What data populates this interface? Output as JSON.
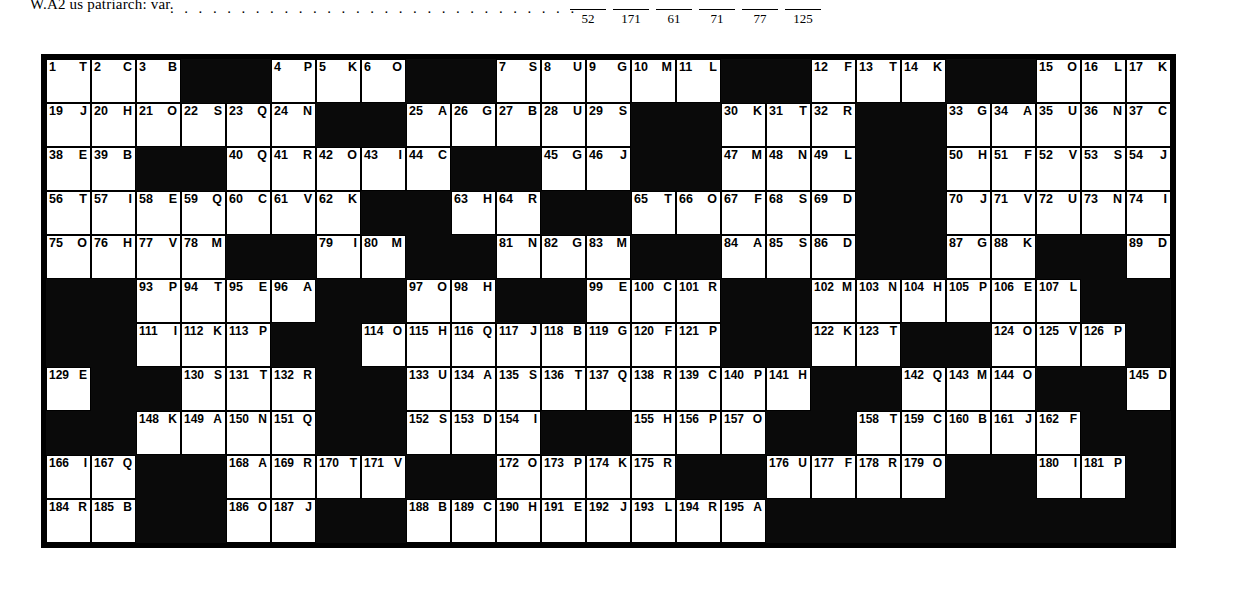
{
  "top_strip": {
    "clue_fragment": "W.A2 us patriarch: var.",
    "dot_leader": ". . . . . . . . . . . . . . . . . . . . . . . . . . . . .",
    "answer_blank_numbers": [
      "52",
      "171",
      "61",
      "71",
      "77",
      "125"
    ]
  },
  "grid": {
    "columns": 25,
    "rows": 11,
    "total_numbered_cells": 195,
    "black_color": "#0a0a0a",
    "white_color": "#ffffff",
    "cells": [
      [
        {
          "n": "1",
          "l": "T"
        },
        {
          "n": "2",
          "l": "C"
        },
        {
          "n": "3",
          "l": "B"
        },
        {
          "black": true
        },
        {
          "black": true
        },
        {
          "n": "4",
          "l": "P"
        },
        {
          "n": "5",
          "l": "K"
        },
        {
          "n": "6",
          "l": "O"
        },
        {
          "black": true
        },
        {
          "black": true
        },
        {
          "n": "7",
          "l": "S"
        },
        {
          "n": "8",
          "l": "U"
        },
        {
          "n": "9",
          "l": "G"
        },
        {
          "n": "10",
          "l": "M"
        },
        {
          "n": "11",
          "l": "L"
        },
        {
          "black": true
        },
        {
          "black": true
        },
        {
          "n": "12",
          "l": "F"
        },
        {
          "n": "13",
          "l": "T"
        },
        {
          "n": "14",
          "l": "K"
        },
        {
          "black": true
        },
        {
          "black": true
        },
        {
          "n": "15",
          "l": "O"
        },
        {
          "n": "16",
          "l": "L"
        },
        {
          "n": "17",
          "l": "K"
        }
      ],
      [
        {
          "n": "19",
          "l": "J"
        },
        {
          "n": "20",
          "l": "H"
        },
        {
          "n": "21",
          "l": "O"
        },
        {
          "n": "22",
          "l": "S"
        },
        {
          "n": "23",
          "l": "Q"
        },
        {
          "n": "24",
          "l": "N"
        },
        {
          "black": true
        },
        {
          "black": true
        },
        {
          "n": "25",
          "l": "A"
        },
        {
          "n": "26",
          "l": "G"
        },
        {
          "n": "27",
          "l": "B"
        },
        {
          "n": "28",
          "l": "U"
        },
        {
          "n": "29",
          "l": "S"
        },
        {
          "black": true
        },
        {
          "black": true
        },
        {
          "n": "30",
          "l": "K"
        },
        {
          "n": "31",
          "l": "T"
        },
        {
          "n": "32",
          "l": "R"
        },
        {
          "black": true
        },
        {
          "black": true
        },
        {
          "n": "33",
          "l": "G"
        },
        {
          "n": "34",
          "l": "A"
        },
        {
          "n": "35",
          "l": "U"
        },
        {
          "n": "36",
          "l": "N"
        },
        {
          "n": "37",
          "l": "C"
        }
      ],
      [
        {
          "n": "38",
          "l": "E"
        },
        {
          "n": "39",
          "l": "B"
        },
        {
          "black": true
        },
        {
          "black": true
        },
        {
          "n": "40",
          "l": "Q"
        },
        {
          "n": "41",
          "l": "R"
        },
        {
          "n": "42",
          "l": "O"
        },
        {
          "n": "43",
          "l": "I"
        },
        {
          "n": "44",
          "l": "C"
        },
        {
          "black": true
        },
        {
          "black": true
        },
        {
          "n": "45",
          "l": "G"
        },
        {
          "n": "46",
          "l": "J"
        },
        {
          "black": true
        },
        {
          "black": true
        },
        {
          "n": "47",
          "l": "M"
        },
        {
          "n": "48",
          "l": "N"
        },
        {
          "n": "49",
          "l": "L"
        },
        {
          "black": true
        },
        {
          "black": true
        },
        {
          "n": "50",
          "l": "H"
        },
        {
          "n": "51",
          "l": "F"
        },
        {
          "n": "52",
          "l": "V"
        },
        {
          "n": "53",
          "l": "S"
        },
        {
          "n": "54",
          "l": "J"
        }
      ],
      [
        {
          "n": "56",
          "l": "T"
        },
        {
          "n": "57",
          "l": "I"
        },
        {
          "n": "58",
          "l": "E"
        },
        {
          "n": "59",
          "l": "Q"
        },
        {
          "n": "60",
          "l": "C"
        },
        {
          "n": "61",
          "l": "V"
        },
        {
          "n": "62",
          "l": "K"
        },
        {
          "black": true
        },
        {
          "black": true
        },
        {
          "n": "63",
          "l": "H"
        },
        {
          "n": "64",
          "l": "R"
        },
        {
          "black": true
        },
        {
          "black": true
        },
        {
          "n": "65",
          "l": "T"
        },
        {
          "n": "66",
          "l": "O"
        },
        {
          "n": "67",
          "l": "F"
        },
        {
          "n": "68",
          "l": "S"
        },
        {
          "n": "69",
          "l": "D"
        },
        {
          "black": true
        },
        {
          "black": true
        },
        {
          "n": "70",
          "l": "J"
        },
        {
          "n": "71",
          "l": "V"
        },
        {
          "n": "72",
          "l": "U"
        },
        {
          "n": "73",
          "l": "N"
        },
        {
          "n": "74",
          "l": "I"
        }
      ],
      [
        {
          "n": "75",
          "l": "O"
        },
        {
          "n": "76",
          "l": "H"
        },
        {
          "n": "77",
          "l": "V"
        },
        {
          "n": "78",
          "l": "M"
        },
        {
          "black": true
        },
        {
          "black": true
        },
        {
          "n": "79",
          "l": "I"
        },
        {
          "n": "80",
          "l": "M"
        },
        {
          "black": true
        },
        {
          "black": true
        },
        {
          "n": "81",
          "l": "N"
        },
        {
          "n": "82",
          "l": "G"
        },
        {
          "n": "83",
          "l": "M"
        },
        {
          "black": true
        },
        {
          "black": true
        },
        {
          "n": "84",
          "l": "A"
        },
        {
          "n": "85",
          "l": "S"
        },
        {
          "n": "86",
          "l": "D"
        },
        {
          "black": true
        },
        {
          "black": true
        },
        {
          "n": "87",
          "l": "G"
        },
        {
          "n": "88",
          "l": "K"
        },
        {
          "black": true
        },
        {
          "black": true
        },
        {
          "n": "89",
          "l": "D"
        }
      ],
      [
        {
          "black": true
        },
        {
          "black": true
        },
        {
          "n": "93",
          "l": "P"
        },
        {
          "n": "94",
          "l": "T"
        },
        {
          "n": "95",
          "l": "E"
        },
        {
          "n": "96",
          "l": "A"
        },
        {
          "black": true
        },
        {
          "black": true
        },
        {
          "n": "97",
          "l": "O"
        },
        {
          "n": "98",
          "l": "H"
        },
        {
          "black": true
        },
        {
          "black": true
        },
        {
          "n": "99",
          "l": "E"
        },
        {
          "n": "100",
          "l": "C"
        },
        {
          "n": "101",
          "l": "R"
        },
        {
          "black": true
        },
        {
          "black": true
        },
        {
          "n": "102",
          "l": "M"
        },
        {
          "n": "103",
          "l": "N"
        },
        {
          "n": "104",
          "l": "H"
        },
        {
          "n": "105",
          "l": "P"
        },
        {
          "n": "106",
          "l": "E"
        },
        {
          "n": "107",
          "l": "L"
        },
        {
          "black": true
        },
        {
          "black": true
        }
      ],
      [
        {
          "black": true
        },
        {
          "black": true
        },
        {
          "n": "111",
          "l": "I"
        },
        {
          "n": "112",
          "l": "K"
        },
        {
          "n": "113",
          "l": "P"
        },
        {
          "black": true
        },
        {
          "black": true
        },
        {
          "n": "114",
          "l": "O"
        },
        {
          "n": "115",
          "l": "H"
        },
        {
          "n": "116",
          "l": "Q"
        },
        {
          "n": "117",
          "l": "J"
        },
        {
          "n": "118",
          "l": "B"
        },
        {
          "n": "119",
          "l": "G"
        },
        {
          "n": "120",
          "l": "F"
        },
        {
          "n": "121",
          "l": "P"
        },
        {
          "black": true
        },
        {
          "black": true
        },
        {
          "n": "122",
          "l": "K"
        },
        {
          "n": "123",
          "l": "T"
        },
        {
          "black": true
        },
        {
          "black": true
        },
        {
          "n": "124",
          "l": "O"
        },
        {
          "n": "125",
          "l": "V"
        },
        {
          "n": "126",
          "l": "P"
        },
        {
          "black": true
        }
      ],
      [
        {
          "n": "129",
          "l": "E"
        },
        {
          "black": true
        },
        {
          "black": true
        },
        {
          "n": "130",
          "l": "S"
        },
        {
          "n": "131",
          "l": "T"
        },
        {
          "n": "132",
          "l": "R"
        },
        {
          "black": true
        },
        {
          "black": true
        },
        {
          "n": "133",
          "l": "U"
        },
        {
          "n": "134",
          "l": "A"
        },
        {
          "n": "135",
          "l": "S"
        },
        {
          "n": "136",
          "l": "T"
        },
        {
          "n": "137",
          "l": "Q"
        },
        {
          "n": "138",
          "l": "R"
        },
        {
          "n": "139",
          "l": "C"
        },
        {
          "n": "140",
          "l": "P"
        },
        {
          "n": "141",
          "l": "H"
        },
        {
          "black": true
        },
        {
          "black": true
        },
        {
          "n": "142",
          "l": "Q"
        },
        {
          "n": "143",
          "l": "M"
        },
        {
          "n": "144",
          "l": "O"
        },
        {
          "black": true
        },
        {
          "black": true
        },
        {
          "n": "145",
          "l": "D"
        }
      ],
      [
        {
          "black": true
        },
        {
          "black": true
        },
        {
          "n": "148",
          "l": "K"
        },
        {
          "n": "149",
          "l": "A"
        },
        {
          "n": "150",
          "l": "N"
        },
        {
          "n": "151",
          "l": "Q"
        },
        {
          "black": true
        },
        {
          "black": true
        },
        {
          "n": "152",
          "l": "S"
        },
        {
          "n": "153",
          "l": "D"
        },
        {
          "n": "154",
          "l": "I"
        },
        {
          "black": true
        },
        {
          "black": true
        },
        {
          "n": "155",
          "l": "H"
        },
        {
          "n": "156",
          "l": "P"
        },
        {
          "n": "157",
          "l": "O"
        },
        {
          "black": true
        },
        {
          "black": true
        },
        {
          "n": "158",
          "l": "T"
        },
        {
          "n": "159",
          "l": "C"
        },
        {
          "n": "160",
          "l": "B"
        },
        {
          "n": "161",
          "l": "J"
        },
        {
          "n": "162",
          "l": "F"
        },
        {
          "black": true
        },
        {
          "black": true
        }
      ],
      [
        {
          "n": "166",
          "l": "I"
        },
        {
          "n": "167",
          "l": "Q"
        },
        {
          "black": true
        },
        {
          "black": true
        },
        {
          "n": "168",
          "l": "A"
        },
        {
          "n": "169",
          "l": "R"
        },
        {
          "n": "170",
          "l": "T"
        },
        {
          "n": "171",
          "l": "V"
        },
        {
          "black": true
        },
        {
          "black": true
        },
        {
          "n": "172",
          "l": "O"
        },
        {
          "n": "173",
          "l": "P"
        },
        {
          "n": "174",
          "l": "K"
        },
        {
          "n": "175",
          "l": "R"
        },
        {
          "black": true
        },
        {
          "black": true
        },
        {
          "n": "176",
          "l": "U"
        },
        {
          "n": "177",
          "l": "F"
        },
        {
          "n": "178",
          "l": "R"
        },
        {
          "n": "179",
          "l": "O"
        },
        {
          "black": true
        },
        {
          "black": true
        },
        {
          "n": "180",
          "l": "I"
        },
        {
          "n": "181",
          "l": "P"
        },
        {
          "black": true
        }
      ],
      [
        {
          "n": "184",
          "l": "R"
        },
        {
          "n": "185",
          "l": "B"
        },
        {
          "black": true
        },
        {
          "black": true
        },
        {
          "n": "186",
          "l": "O"
        },
        {
          "n": "187",
          "l": "J"
        },
        {
          "black": true
        },
        {
          "black": true
        },
        {
          "n": "188",
          "l": "B"
        },
        {
          "n": "189",
          "l": "C"
        },
        {
          "n": "190",
          "l": "H"
        },
        {
          "n": "191",
          "l": "E"
        },
        {
          "n": "192",
          "l": "J"
        },
        {
          "n": "193",
          "l": "L"
        },
        {
          "n": "194",
          "l": "R"
        },
        {
          "n": "195",
          "l": "A"
        },
        {
          "black": true
        },
        {
          "black": true
        },
        {
          "black": true
        },
        {
          "black": true
        },
        {
          "black": true
        },
        {
          "black": true
        },
        {
          "black": true
        },
        {
          "black": true
        },
        {
          "black": true
        }
      ]
    ],
    "row_tail_cells": [
      {
        "row": 0,
        "n": "18",
        "l": "C"
      },
      {
        "row": 2,
        "n": "55",
        "l": "M"
      },
      {
        "row": 4,
        "n": "90",
        "l": "Q"
      },
      {
        "row": 4,
        "n": "91",
        "l": "P"
      },
      {
        "row": 4,
        "n": "92",
        "l": "L"
      },
      {
        "row": 5,
        "n": "108",
        "l": "F"
      },
      {
        "row": 5,
        "n": "109",
        "l": "J"
      },
      {
        "row": 5,
        "n": "110",
        "l": "O"
      },
      {
        "row": 6,
        "n": "127",
        "l": "B"
      },
      {
        "row": 6,
        "n": "128",
        "l": "D"
      },
      {
        "row": 7,
        "n": "146",
        "l": "T"
      },
      {
        "row": 7,
        "n": "147",
        "l": "U"
      },
      {
        "row": 8,
        "n": "163",
        "l": "G"
      },
      {
        "row": 8,
        "n": "164",
        "l": "N"
      },
      {
        "row": 8,
        "n": "165",
        "l": "J"
      },
      {
        "row": 9,
        "n": "182",
        "l": "H"
      },
      {
        "row": 9,
        "n": "183",
        "l": "G"
      }
    ]
  }
}
